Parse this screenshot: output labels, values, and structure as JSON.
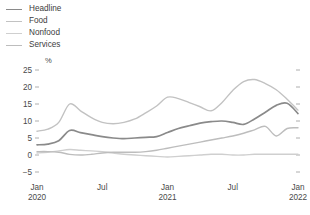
{
  "legend": {
    "position": "top-left",
    "items": [
      {
        "label": "Headline",
        "color": "#8a8a8a"
      },
      {
        "label": "Food",
        "color": "#c2c2c2"
      },
      {
        "label": "Nonfood",
        "color": "#cfcfcf"
      },
      {
        "label": "Services",
        "color": "#bdbdbd"
      }
    ]
  },
  "axes": {
    "y_unit": "%",
    "y_ticks": [
      "25",
      "20",
      "15",
      "10",
      "5",
      "0",
      "-5"
    ],
    "x_ticks": [
      {
        "top": "Jan",
        "bottom": "2020"
      },
      {
        "top": "Jul",
        "bottom": ""
      },
      {
        "top": "Jan",
        "bottom": "2021"
      },
      {
        "top": "Jul",
        "bottom": ""
      },
      {
        "top": "Jan",
        "bottom": "2022"
      }
    ]
  },
  "chart_data": {
    "type": "line",
    "title": "",
    "subtitle": "",
    "xlabel": "",
    "ylabel": "%",
    "ylim": [
      -5,
      25
    ],
    "yticks": [
      -5,
      0,
      5,
      10,
      15,
      20,
      25
    ],
    "grid": false,
    "legend_position": "top-left",
    "x": [
      "Jan 2020",
      "Feb 2020",
      "Mar 2020",
      "Apr 2020",
      "May 2020",
      "Jun 2020",
      "Jul 2020",
      "Aug 2020",
      "Sep 2020",
      "Oct 2020",
      "Nov 2020",
      "Dec 2020",
      "Jan 2021",
      "Feb 2021",
      "Mar 2021",
      "Apr 2021",
      "May 2021",
      "Jun 2021",
      "Jul 2021",
      "Aug 2021",
      "Sep 2021",
      "Oct 2021",
      "Nov 2021",
      "Dec 2021",
      "Jan 2022"
    ],
    "xtick_labels": [
      "Jan 2020",
      "Jul",
      "Jan 2021",
      "Jul",
      "Jan 2022"
    ],
    "series": [
      {
        "name": "Headline",
        "color": "#8a8a8a",
        "width": 1.7,
        "values": [
          3.0,
          3.2,
          4.2,
          7.2,
          6.6,
          6.0,
          5.4,
          5.0,
          4.8,
          5.0,
          5.2,
          5.4,
          6.6,
          7.8,
          8.6,
          9.4,
          9.8,
          10.0,
          9.6,
          9.0,
          10.6,
          12.6,
          14.6,
          15.2,
          12.2
        ]
      },
      {
        "name": "Food",
        "color": "#c2c2c2",
        "width": 1.4,
        "values": [
          7.0,
          7.6,
          9.6,
          15.0,
          13.0,
          11.0,
          9.6,
          9.2,
          9.6,
          10.6,
          12.4,
          14.4,
          17.0,
          16.6,
          15.4,
          14.2,
          13.0,
          15.4,
          19.0,
          21.6,
          22.2,
          21.0,
          19.2,
          16.4,
          13.2
        ]
      },
      {
        "name": "Nonfood",
        "color": "#cfcfcf",
        "width": 1.4,
        "values": [
          0.6,
          0.8,
          1.2,
          1.6,
          1.4,
          1.2,
          1.0,
          0.6,
          0.2,
          0.0,
          -0.2,
          -0.4,
          -0.6,
          -0.4,
          -0.2,
          0.0,
          0.2,
          0.2,
          0.0,
          0.0,
          0.2,
          0.2,
          0.2,
          0.2,
          0.2
        ]
      },
      {
        "name": "Services",
        "color": "#bdbdbd",
        "width": 1.4,
        "values": [
          1.0,
          1.0,
          0.8,
          0.2,
          0.0,
          0.2,
          0.6,
          0.8,
          0.8,
          0.8,
          1.0,
          1.4,
          2.0,
          2.6,
          3.2,
          3.8,
          4.4,
          5.0,
          5.6,
          6.4,
          7.4,
          8.4,
          5.6,
          7.8,
          8.0
        ]
      }
    ]
  }
}
